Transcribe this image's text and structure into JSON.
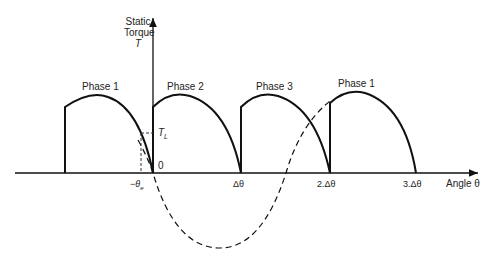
{
  "diagram": {
    "type": "stepper-motor static torque vs angle",
    "y_axis": {
      "label_line1": "Static",
      "label_line2": "Torque",
      "label_line3": "T"
    },
    "x_axis": {
      "label": "Angle θ"
    },
    "ticks": {
      "neg_theta_e": "−θ",
      "neg_theta_e_sub": "e",
      "zero": "0",
      "delta": "Δθ",
      "two_delta": "2.Δθ",
      "three_delta": "3.Δθ"
    },
    "load_torque": {
      "label": "T",
      "sub": "L"
    },
    "phases": [
      {
        "label": "Phase 1"
      },
      {
        "label": "Phase 2"
      },
      {
        "label": "Phase 3"
      },
      {
        "label": "Phase 1"
      }
    ],
    "colors": {
      "line": "#111111",
      "background": "#ffffff"
    }
  }
}
